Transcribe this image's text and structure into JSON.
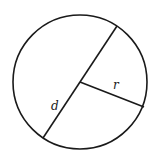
{
  "diagram": {
    "type": "circle-diameter-radius",
    "stroke_color": "#1a1a1a",
    "background": "#ffffff",
    "circle": {
      "cx": 80,
      "cy": 82,
      "r": 67
    },
    "diameter": {
      "x1": 117,
      "y1": 26,
      "x2": 43,
      "y2": 138,
      "label": "d",
      "label_x": 51,
      "label_y": 110
    },
    "radius": {
      "x1": 80,
      "y1": 82,
      "x2": 144,
      "y2": 107,
      "label": "r",
      "label_x": 113,
      "label_y": 89
    }
  }
}
